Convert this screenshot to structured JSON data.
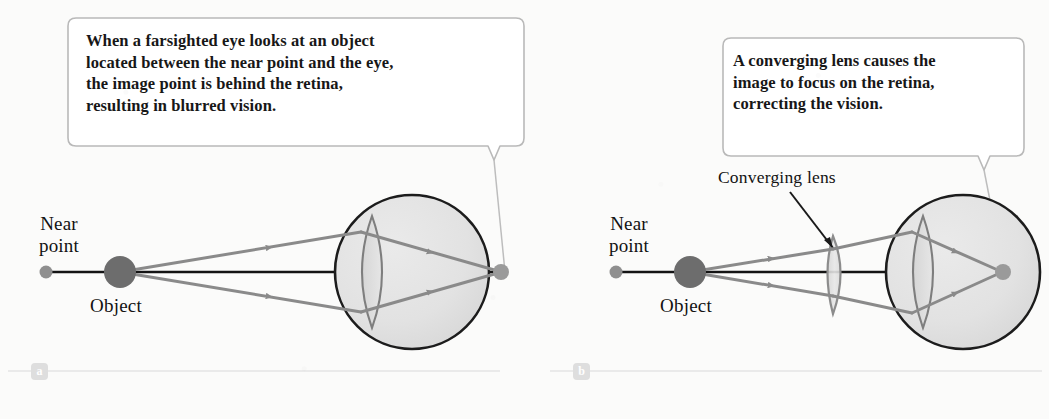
{
  "figure": {
    "background_color": "#fbfbfa",
    "ink_color": "#171717",
    "ray_color": "#8a8a8a",
    "eye_fill_color": "#e2e2e2",
    "eye_outline_color": "#1c1c1c",
    "callout_border_color": "#b9b9b9",
    "panel_letter_bg_color": "#dedede",
    "type": "optics-ray-diagram",
    "topic": "Farsighted eye and its correction with a converging lens"
  },
  "panel_a": {
    "letter": "a",
    "callout": "When a farsighted eye looks at an object\nlocated between the near point and the eye,\nthe image point is behind the retina,\nresulting in blurred vision.",
    "near_point_label": "Near\npoint",
    "object_label": "Object",
    "focus_position": "behind-retina"
  },
  "panel_b": {
    "letter": "b",
    "callout": "A converging lens causes the\nimage to focus on the retina,\ncorrecting the vision.",
    "near_point_label": "Near\npoint",
    "object_label": "Object",
    "lens_label": "Converging lens",
    "focus_position": "on-retina"
  }
}
